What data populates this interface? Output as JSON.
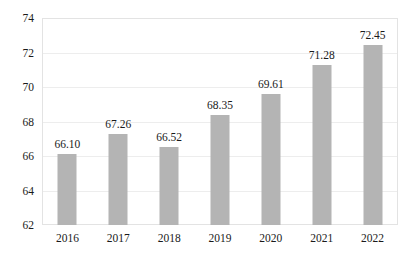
{
  "chart_data": {
    "type": "bar",
    "title": "",
    "subtitle": "",
    "xlabel": "",
    "ylabel": "",
    "categories": [
      "2016",
      "2017",
      "2018",
      "2019",
      "2020",
      "2021",
      "2022"
    ],
    "values": [
      66.1,
      67.26,
      66.52,
      68.35,
      69.61,
      71.28,
      72.45
    ],
    "data_labels": [
      "66.10",
      "67.26",
      "66.52",
      "68.35",
      "69.61",
      "71.28",
      "72.45"
    ],
    "ylim": [
      62,
      74
    ],
    "yticks": [
      62,
      64,
      66,
      68,
      70,
      72,
      74
    ],
    "ytick_labels": [
      "62",
      "64",
      "66",
      "68",
      "70",
      "72",
      "74"
    ],
    "grid": true,
    "grid_axis": "y",
    "legend": null,
    "legend_position": "none",
    "bar_color": "#b4b4b4",
    "gridline_color": "#ededed",
    "frame_color": "#e3e3e3",
    "text_color": "#1a1a1a",
    "background_color": "#ffffff"
  }
}
